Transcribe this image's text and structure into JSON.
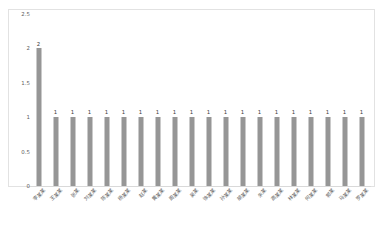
{
  "chart_data": {
    "type": "bar",
    "title": "",
    "subtitle": "",
    "xlabel": "",
    "ylabel": "",
    "ylim": [
      0,
      2.5
    ],
    "grid": false,
    "legend": false,
    "legend_position": "none",
    "bar_color": "#969696",
    "background_color": "#ffffff",
    "border_color": "#e2e2e2",
    "label_color": "#5c5c5c",
    "value_label_color": "#3a3a3a",
    "yticks": [
      "2.5",
      "2",
      "1.5",
      "1",
      "0.5",
      "0"
    ],
    "ytick_values": [
      2.5,
      2,
      1.5,
      1,
      0.5,
      0
    ],
    "categories": [
      "李某某",
      "王某某",
      "张某",
      "刘某某",
      "陈某某",
      "杨某某",
      "赵某",
      "黄某某",
      "周某某",
      "吴某",
      "徐某某",
      "孙某某",
      "胡某某",
      "朱某",
      "高某某",
      "林某某",
      "何某某",
      "郭某",
      "马某某",
      "罗某某"
    ],
    "values": [
      2,
      1,
      1,
      1,
      1,
      1,
      1,
      1,
      1,
      1,
      1,
      1,
      1,
      1,
      1,
      1,
      1,
      1,
      1,
      1
    ],
    "value_labels": [
      "2",
      "1",
      "1",
      "1",
      "1",
      "1",
      "1",
      "1",
      "1",
      "1",
      "1",
      "1",
      "1",
      "1",
      "1",
      "1",
      "1",
      "1",
      "1",
      "1"
    ]
  }
}
